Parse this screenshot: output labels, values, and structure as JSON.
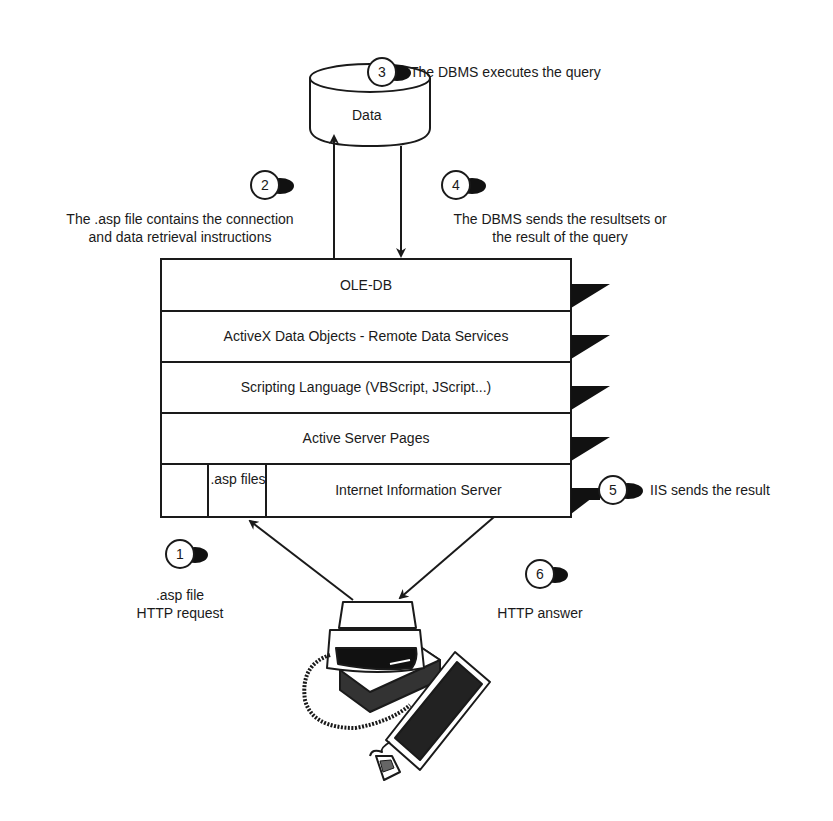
{
  "diagram": {
    "database": {
      "label": "Data",
      "icon": "database-cylinder-icon"
    },
    "layers": [
      {
        "id": "ole-db",
        "label": "OLE-DB"
      },
      {
        "id": "ado-rds",
        "label": "ActiveX Data Objects - Remote Data Services"
      },
      {
        "id": "scripting",
        "label": "Scripting Language (VBScript, JScript...)"
      },
      {
        "id": "asp",
        "label": "Active Server Pages"
      },
      {
        "id": "iis",
        "label": "Internet Information Server",
        "sub_label": ".asp files"
      }
    ],
    "steps": [
      {
        "number": "1",
        "text_line1": ".asp file",
        "text_line2": "HTTP request"
      },
      {
        "number": "2",
        "text_line1": "The .asp file contains the connection",
        "text_line2": "and data retrieval instructions"
      },
      {
        "number": "3",
        "text_line1": "The DBMS executes the query"
      },
      {
        "number": "4",
        "text_line1": "The DBMS sends the resultsets or",
        "text_line2": "the result of the query"
      },
      {
        "number": "5",
        "text_line1": "IIS sends the result"
      },
      {
        "number": "6",
        "text_line1": "HTTP answer"
      }
    ],
    "client": {
      "icon": "desktop-computer-icon"
    },
    "colors": {
      "stroke": "#1a1a1a",
      "fill": "#ffffff",
      "shadow": "#111111"
    }
  }
}
